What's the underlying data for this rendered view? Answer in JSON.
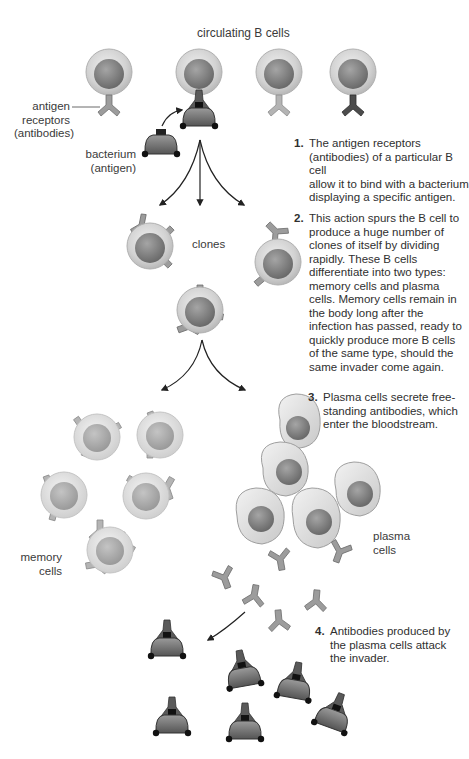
{
  "diagram": {
    "title": "circulating B cells",
    "labels": {
      "antigen_receptors": [
        "antigen",
        "receptors",
        "(antibodies)"
      ],
      "bacterium": [
        "bacterium",
        "(antigen)"
      ],
      "clones": "clones",
      "memory_cells": [
        "memory",
        "cells"
      ],
      "plasma_cells": [
        "plasma",
        "cells"
      ]
    },
    "steps": [
      {
        "number": "1.",
        "lines": [
          "The antigen receptors",
          "(antibodies) of a particular B cell",
          "allow it to bind with a bacterium",
          "displaying a specific antigen."
        ]
      },
      {
        "number": "2.",
        "lines": [
          "This action spurs the B cell to",
          "produce a huge number of",
          "clones of itself by dividing",
          "rapidly. These B cells",
          "differentiate into two types:",
          "memory cells and plasma",
          "cells. Memory cells remain in",
          "the body long after the",
          "infection has passed, ready to",
          "quickly produce more B cells",
          "of the same type, should the",
          "same invader come again."
        ]
      },
      {
        "number": "3.",
        "lines": [
          "Plasma cells secrete free-",
          "standing antibodies, which",
          "enter the bloodstream."
        ]
      },
      {
        "number": "4.",
        "lines": [
          "Antibodies produced by",
          "the plasma cells attack",
          "the invader."
        ]
      }
    ],
    "colors": {
      "cell_outer": "#d4d4d4",
      "cell_nucleus": "#8a8a8a",
      "antibody": "#9a9a9a",
      "antibody_dark": "#555555",
      "bacterium": "#6a6a6a",
      "arrow": "#222222",
      "text": "#333333"
    }
  }
}
